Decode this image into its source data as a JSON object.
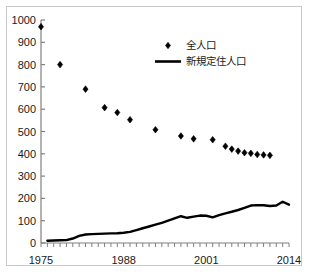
{
  "chart_data": {
    "type": "scatter",
    "title": "",
    "xlabel": "",
    "ylabel": "",
    "xlim": [
      1975,
      2014
    ],
    "ylim": [
      0,
      1000
    ],
    "grid": false,
    "legend_position": "top-center",
    "x_ticks_labeled": [
      "1975",
      "1988",
      "2001",
      "2014"
    ],
    "x_ticks_labeled_values": [
      1975,
      1988,
      2001,
      2014
    ],
    "x_tick_interval": 1,
    "y_ticks": [
      "0",
      "100",
      "200",
      "300",
      "400",
      "500",
      "600",
      "700",
      "800",
      "900",
      "1000"
    ],
    "y_tick_values": [
      0,
      100,
      200,
      300,
      400,
      500,
      600,
      700,
      800,
      900,
      1000
    ],
    "series": [
      {
        "name": "全人口",
        "marker": "diamond",
        "style": "markers",
        "color": "#000000",
        "x": [
          1975,
          1978,
          1982,
          1985,
          1987,
          1989,
          1993,
          1997,
          1999,
          2002,
          2004,
          2005,
          2006,
          2007,
          2008,
          2009,
          2010,
          2011
        ],
        "values": [
          970,
          800,
          690,
          607,
          585,
          553,
          508,
          480,
          467,
          463,
          434,
          421,
          412,
          405,
          402,
          397,
          395,
          393
        ]
      },
      {
        "name": "新規定住人口",
        "marker": "none",
        "style": "line",
        "color": "#000000",
        "x": [
          1976,
          1977,
          1978,
          1979,
          1980,
          1981,
          1982,
          1983,
          1984,
          1985,
          1986,
          1987,
          1988,
          1989,
          1990,
          1991,
          1992,
          1993,
          1994,
          1995,
          1996,
          1997,
          1998,
          1999,
          2000,
          2001,
          2002,
          2003,
          2004,
          2005,
          2006,
          2007,
          2008,
          2009,
          2010,
          2011,
          2012,
          2013,
          2014
        ],
        "values": [
          10,
          11,
          12,
          13,
          20,
          32,
          38,
          40,
          41,
          42,
          43,
          44,
          46,
          50,
          58,
          66,
          74,
          82,
          90,
          100,
          110,
          120,
          113,
          118,
          123,
          122,
          115,
          125,
          133,
          140,
          148,
          158,
          168,
          170,
          169,
          166,
          168,
          185,
          172
        ]
      }
    ]
  },
  "legend": {
    "entries": [
      {
        "label": "全人口",
        "marker": "diamond-marker-icon"
      },
      {
        "label": "新規定住人口",
        "marker": "line-marker-icon"
      }
    ]
  },
  "colors": {
    "series": "#000000",
    "axis": "#808080",
    "frame": "#c8c8c8",
    "background": "#ffffff",
    "text": "#1a1a1a"
  }
}
